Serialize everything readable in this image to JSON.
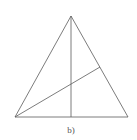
{
  "figure": {
    "label": "b)",
    "stroke_color": "#5a5a5a",
    "label_color": "#555555",
    "triangle": {
      "apex": [
        71,
        16
      ],
      "bottom_left": [
        15,
        117
      ],
      "bottom_right": [
        128,
        117
      ]
    },
    "segments": [
      {
        "name": "altitude-from-apex",
        "from": [
          71,
          16
        ],
        "to": [
          71,
          117
        ]
      },
      {
        "name": "cevian-from-bottom-left",
        "from": [
          15,
          117
        ],
        "to": [
          100,
          67
        ]
      }
    ]
  }
}
